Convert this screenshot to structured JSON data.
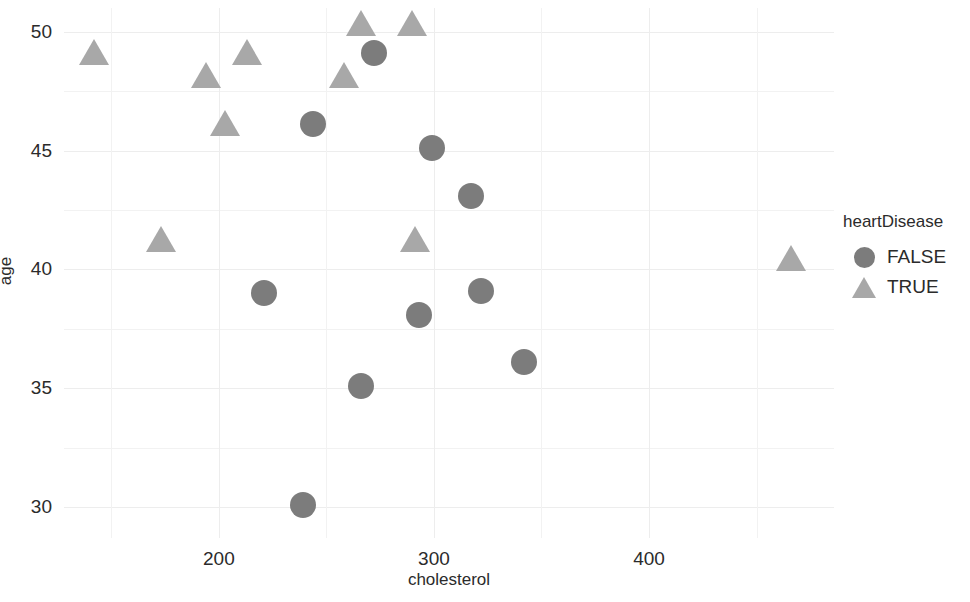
{
  "chart_data": {
    "type": "scatter",
    "title": "",
    "xlabel": "cholesterol",
    "ylabel": "age",
    "xlim": [
      128,
      486
    ],
    "ylim": [
      28.7,
      51.0
    ],
    "xticks": [
      200,
      300,
      400
    ],
    "yticks": [
      30,
      35,
      40,
      45,
      50
    ],
    "grid": true,
    "legend": {
      "title": "heartDisease",
      "position": "right",
      "entries": [
        {
          "label": "FALSE",
          "marker": "circle",
          "color": "#7c7c7c"
        },
        {
          "label": "TRUE",
          "marker": "triangle",
          "color": "#a8a8a8"
        }
      ]
    },
    "series": [
      {
        "name": "FALSE",
        "marker": "circle",
        "color": "#7c7c7c",
        "points": [
          {
            "cholesterol": 244,
            "age": 46.1
          },
          {
            "cholesterol": 272,
            "age": 49.1
          },
          {
            "cholesterol": 299,
            "age": 45.1
          },
          {
            "cholesterol": 317,
            "age": 43.1
          },
          {
            "cholesterol": 221,
            "age": 39.0
          },
          {
            "cholesterol": 293,
            "age": 38.1
          },
          {
            "cholesterol": 322,
            "age": 39.1
          },
          {
            "cholesterol": 266,
            "age": 35.1
          },
          {
            "cholesterol": 342,
            "age": 36.1
          },
          {
            "cholesterol": 239,
            "age": 30.1
          }
        ]
      },
      {
        "name": "TRUE",
        "marker": "triangle",
        "color": "#a8a8a8",
        "points": [
          {
            "cholesterol": 142,
            "age": 49.0
          },
          {
            "cholesterol": 194,
            "age": 48.0
          },
          {
            "cholesterol": 213,
            "age": 49.0
          },
          {
            "cholesterol": 203,
            "age": 46.0
          },
          {
            "cholesterol": 258,
            "age": 48.0
          },
          {
            "cholesterol": 266,
            "age": 50.2
          },
          {
            "cholesterol": 290,
            "age": 50.2
          },
          {
            "cholesterol": 291,
            "age": 41.1
          },
          {
            "cholesterol": 173,
            "age": 41.1
          },
          {
            "cholesterol": 466,
            "age": 40.3
          }
        ]
      }
    ],
    "gridlines": {
      "x_major": [
        200,
        300,
        400
      ],
      "x_minor": [
        150,
        250,
        350,
        450
      ],
      "y_major": [
        30,
        35,
        40,
        45,
        50
      ],
      "y_minor": [
        32.5,
        37.5,
        42.5,
        47.5
      ]
    }
  }
}
